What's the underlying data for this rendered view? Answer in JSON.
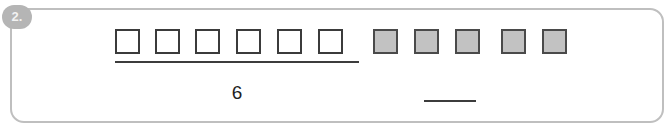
{
  "item": {
    "number_badge": "2.",
    "group_count_label": "6",
    "answer_blank_value": ""
  },
  "colors": {
    "card_border": "#bfbfbf",
    "badge_background": "#b5b5b5",
    "badge_text": "#f2f2f2",
    "square_border": "#3b3b3b",
    "square_empty_fill": "#ffffff",
    "square_filled_fill": "#c2c2c2",
    "line_color": "#3c3c3c",
    "page_background": "#ffffff"
  },
  "squares": [
    {
      "index": 1,
      "state": "empty",
      "x": 115
    },
    {
      "index": 2,
      "state": "empty",
      "x": 155
    },
    {
      "index": 3,
      "state": "empty",
      "x": 195
    },
    {
      "index": 4,
      "state": "empty",
      "x": 236
    },
    {
      "index": 5,
      "state": "empty",
      "x": 277
    },
    {
      "index": 6,
      "state": "empty",
      "x": 318
    },
    {
      "index": 7,
      "state": "filled",
      "x": 373
    },
    {
      "index": 8,
      "state": "filled",
      "x": 414
    },
    {
      "index": 9,
      "state": "filled",
      "x": 455
    },
    {
      "index": 10,
      "state": "filled",
      "x": 501
    },
    {
      "index": 11,
      "state": "filled",
      "x": 542
    }
  ],
  "groups": [
    {
      "name": "labeled-group",
      "count_label": "6",
      "square_count": 6
    },
    {
      "name": "unlabeled-group",
      "count_label": "",
      "square_count": 5
    }
  ]
}
